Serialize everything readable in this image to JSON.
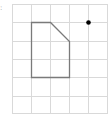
{
  "diagram": {
    "type": "grid-shape",
    "label": ":",
    "grid": {
      "columns": 5,
      "rows": 6,
      "origin_x": 12,
      "origin_y": 4,
      "cell_w": 19,
      "cell_h": 18.2,
      "line_color": "#d9d9d9"
    },
    "shape": {
      "name": "pentagon",
      "vertices_grid": [
        [
          1,
          1
        ],
        [
          2,
          1
        ],
        [
          3,
          2
        ],
        [
          3,
          4
        ],
        [
          1,
          4
        ]
      ],
      "stroke": "#7a7a7a"
    },
    "point": {
      "grid": [
        4,
        1
      ],
      "color": "#000000"
    }
  }
}
